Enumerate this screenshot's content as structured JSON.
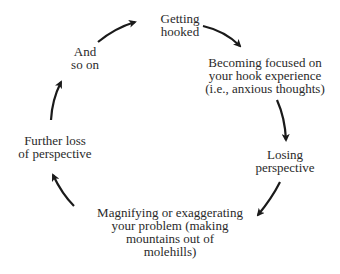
{
  "diagram": {
    "type": "cycle",
    "nodes": [
      {
        "id": "getting-hooked",
        "label": "Getting\nhooked"
      },
      {
        "id": "becoming-focused",
        "label": "Becoming focused on\nyour hook experience\n(i.e., anxious thoughts)"
      },
      {
        "id": "losing-perspective",
        "label": "Losing\nperspective"
      },
      {
        "id": "magnifying",
        "label": "Magnifying or exaggerating\nyour problem (making\nmountains out of\nmolehills)"
      },
      {
        "id": "further-loss",
        "label": "Further loss\nof perspective"
      },
      {
        "id": "and-so-on",
        "label": "And\nso on"
      }
    ],
    "edges": [
      {
        "from": "getting-hooked",
        "to": "becoming-focused"
      },
      {
        "from": "becoming-focused",
        "to": "losing-perspective"
      },
      {
        "from": "losing-perspective",
        "to": "magnifying"
      },
      {
        "from": "magnifying",
        "to": "further-loss"
      },
      {
        "from": "further-loss",
        "to": "and-so-on"
      },
      {
        "from": "and-so-on",
        "to": "getting-hooked"
      }
    ],
    "colors": {
      "text": "#2a2a2a",
      "arrow": "#1a1a1a",
      "background": "#ffffff"
    }
  }
}
